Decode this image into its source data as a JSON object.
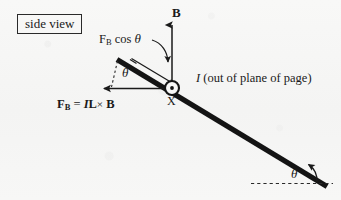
{
  "figure": {
    "domain_kind": "physics-force-diagram",
    "background_color": "#f7f7f6",
    "ink_color": "#1a1a1a"
  },
  "labels": {
    "side_view": "side view",
    "force_component": {
      "prefix": "F",
      "subscript": "B",
      "suffix": " cos ",
      "angle": "θ"
    },
    "magnetic_field": "B",
    "current": {
      "symbol": "I",
      "description": " (out of plane of page)"
    },
    "cross_mark": "X",
    "force_equation": {
      "force": "F",
      "force_subscript": "B",
      "equals": " = ",
      "current": "I",
      "length": "L",
      "cross": "×",
      "field": "B"
    },
    "theta_rod": "θ",
    "theta_incline": "θ"
  },
  "geometry": {
    "rod": {
      "x1": 117,
      "y1": 60,
      "x2": 326,
      "y2": 186,
      "width": 5
    },
    "current_marker": {
      "cx": 172,
      "cy": 88,
      "r": 7,
      "dot_r": 1.8,
      "type": "out-of-page"
    },
    "field_arrow": {
      "x1": 172,
      "y1": 88,
      "x2": 172,
      "y2": 22
    },
    "force_arrow": {
      "x1": 166,
      "y1": 88,
      "x2": 103,
      "y2": 88
    },
    "dashed_vertical": {
      "x1": 117,
      "y1": 61,
      "x2": 112,
      "y2": 90
    },
    "dashed_horizontal": {
      "x1": 252,
      "y1": 183,
      "x2": 330,
      "y2": 183
    },
    "component_vector": {
      "x1": 133,
      "y1": 59,
      "x2": 174,
      "y2": 84
    },
    "pointer_curve": {
      "from_x": 157,
      "from_y": 40,
      "to_x": 168,
      "to_y": 66
    },
    "incline_arc": {
      "cx": 312,
      "cy": 183,
      "radius": 17
    }
  }
}
